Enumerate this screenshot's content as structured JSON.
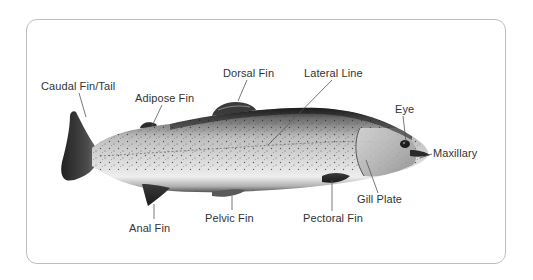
{
  "diagram": {
    "colors": {
      "frame_border": "#bdbdbd",
      "label_text": "#333333",
      "leader_line": "#555555",
      "fish_dark": "#2a2a2a",
      "fish_mid": "#8a8a8a",
      "fish_light": "#e6e6e6"
    },
    "labels": [
      {
        "id": "caudal-fin-tail",
        "text": "Caudal Fin/Tail",
        "x": 41,
        "y": 80,
        "line": [
          [
            79,
            93
          ],
          [
            86,
            117
          ]
        ]
      },
      {
        "id": "adipose-fin",
        "text": "Adipose Fin",
        "x": 135,
        "y": 92,
        "line": [
          [
            162,
            105
          ],
          [
            152,
            126
          ]
        ]
      },
      {
        "id": "dorsal-fin",
        "text": "Dorsal Fin",
        "x": 223,
        "y": 67,
        "line": [
          [
            247,
            80
          ],
          [
            238,
            101
          ]
        ]
      },
      {
        "id": "lateral-line",
        "text": "Lateral Line",
        "x": 304,
        "y": 67,
        "line": [
          [
            332,
            80
          ],
          [
            268,
            145
          ]
        ]
      },
      {
        "id": "eye",
        "text": "Eye",
        "x": 395,
        "y": 103,
        "line": [
          [
            403,
            116
          ],
          [
            406,
            142
          ]
        ]
      },
      {
        "id": "maxillary",
        "text": "Maxillary",
        "x": 433,
        "y": 147,
        "line": [
          [
            432,
            154
          ],
          [
            420,
            158
          ]
        ]
      },
      {
        "id": "gill-plate",
        "text": "Gill Plate",
        "x": 357,
        "y": 193,
        "line": [
          [
            378,
            193
          ],
          [
            366,
            160
          ]
        ]
      },
      {
        "id": "pectoral-fin",
        "text": "Pectoral Fin",
        "x": 303,
        "y": 212,
        "line": [
          [
            332,
            211
          ],
          [
            332,
            180
          ]
        ]
      },
      {
        "id": "pelvic-fin",
        "text": "Pelvic Fin",
        "x": 205,
        "y": 212,
        "line": [
          [
            232,
            210
          ],
          [
            232,
            196
          ]
        ]
      },
      {
        "id": "anal-fin",
        "text": "Anal Fin",
        "x": 129,
        "y": 222,
        "line": [
          [
            154,
            219
          ],
          [
            154,
            204
          ]
        ]
      }
    ]
  }
}
